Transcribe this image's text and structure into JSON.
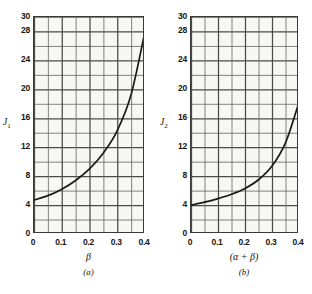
{
  "figure": {
    "panels": [
      {
        "caption": "(a)",
        "ylabel": "J",
        "ylabel_sub": "1",
        "xlabel": "β",
        "yticks": [
          "0",
          "4",
          "8",
          "12",
          "16",
          "20",
          "24",
          "28",
          "30"
        ],
        "ytick_values": [
          0,
          4,
          8,
          12,
          16,
          20,
          24,
          28,
          30
        ],
        "xticks": [
          "0",
          "0.1",
          "0.2",
          "0.3",
          "0.4"
        ],
        "xtick_values": [
          0,
          0.1,
          0.2,
          0.3,
          0.4
        ]
      },
      {
        "caption": "(b)",
        "ylabel": "J",
        "ylabel_sub": "2",
        "xlabel": "(α + β)",
        "yticks": [
          "0",
          "4",
          "8",
          "12",
          "16",
          "20",
          "24",
          "28",
          "30"
        ],
        "ytick_values": [
          0,
          4,
          8,
          12,
          16,
          20,
          24,
          28,
          30
        ],
        "xticks": [
          "0",
          "0.1",
          "0.2",
          "0.3",
          "0.4"
        ],
        "xtick_values": [
          0,
          0.1,
          0.2,
          0.3,
          0.4
        ]
      }
    ]
  },
  "chart_data": [
    {
      "type": "line",
      "title": "(a)",
      "xlabel": "β",
      "ylabel": "J1",
      "xlim": [
        0,
        0.4
      ],
      "ylim": [
        0,
        30
      ],
      "grid": true,
      "grid_minor_x_step": 0.05,
      "grid_minor_y_step": 2,
      "legend": "none",
      "x": [
        0,
        0.05,
        0.1,
        0.15,
        0.2,
        0.25,
        0.3,
        0.35,
        0.4
      ],
      "y": [
        4.7,
        5.3,
        6.2,
        7.4,
        9.0,
        11.2,
        14.3,
        19.3,
        28.0
      ]
    },
    {
      "type": "line",
      "title": "(b)",
      "xlabel": "(α + β)",
      "ylabel": "J2",
      "xlim": [
        0,
        0.4
      ],
      "ylim": [
        0,
        30
      ],
      "grid": true,
      "grid_minor_x_step": 0.05,
      "grid_minor_y_step": 2,
      "legend": "none",
      "x": [
        0,
        0.05,
        0.1,
        0.15,
        0.2,
        0.25,
        0.3,
        0.35,
        0.4
      ],
      "y": [
        4.0,
        4.4,
        4.9,
        5.5,
        6.3,
        7.5,
        9.4,
        12.6,
        18.2
      ]
    }
  ],
  "colors": {
    "curve": "#1a1a18",
    "grid_major": "#4a4a46",
    "grid_minor": "#6d6d68",
    "axis": "#3a3a38",
    "plot_bg": "#f7f7f4",
    "page_bg": "#ffffff",
    "text": "#17150f"
  }
}
